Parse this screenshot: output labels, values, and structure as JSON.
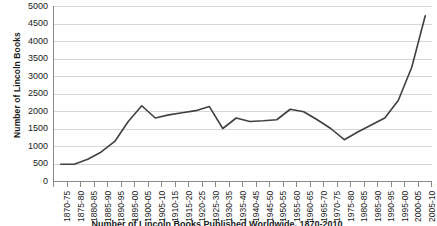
{
  "chart_data": {
    "type": "line",
    "title": "Number of Lincoln Books Published Worldwide, 1870-2010",
    "xlabel": "",
    "ylabel": "Number of Lincoln Books",
    "ylim": [
      0,
      5000
    ],
    "ytick_step": 500,
    "grid": true,
    "legend": "none",
    "line_color": "#404040",
    "categories": [
      "1870-75",
      "1875-80",
      "1880-85",
      "1885-90",
      "1890-95",
      "1895-00",
      "1900-05",
      "1905-10",
      "1910-15",
      "1915-20",
      "1920-25",
      "1925-30",
      "1930-35",
      "1935-40",
      "1940-45",
      "1945-50",
      "1950-55",
      "1955-60",
      "1960-65",
      "1965-70",
      "1970-75",
      "1975-80",
      "1980-85",
      "1985-90",
      "1990-95",
      "1995-00",
      "2000-05",
      "2005-10"
    ],
    "values": [
      480,
      480,
      620,
      830,
      1130,
      1700,
      2150,
      1800,
      1890,
      1950,
      2010,
      2130,
      1500,
      1800,
      1700,
      1720,
      1750,
      2050,
      1980,
      1750,
      1500,
      1180,
      1400,
      1600,
      1800,
      2300,
      3250,
      4720
    ],
    "ytick_labels": [
      "5000",
      "4500",
      "4000",
      "3500",
      "3000",
      "2500",
      "2000",
      "1500",
      "1000",
      "500",
      "0"
    ]
  },
  "axis": {
    "y_title": "Number of Lincoln Books"
  },
  "caption": {
    "text": "Number of Lincoln Books Published Worldwide, 1870-2010"
  }
}
